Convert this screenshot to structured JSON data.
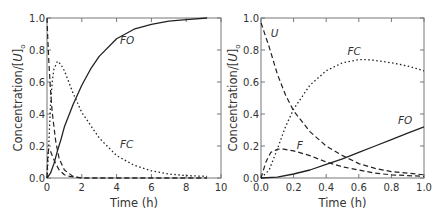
{
  "chart_data": [
    {
      "type": "line",
      "title": "",
      "xlabel": "Time (h)",
      "ylabel": "Concentration/[U]o",
      "xlim": [
        0,
        10
      ],
      "ylim": [
        0,
        1.0
      ],
      "xticks": [
        "0",
        "2",
        "4",
        "6",
        "8",
        "10"
      ],
      "yticks": [
        "0.0",
        "0.2",
        "0.4",
        "0.6",
        "0.8",
        "1.0"
      ],
      "grid": false,
      "series": [
        {
          "name": "U",
          "style": "dashed",
          "x": [
            0,
            0.05,
            0.1,
            0.2,
            0.3,
            0.5,
            0.7,
            1.0,
            1.5,
            2,
            4,
            6,
            8,
            9.2
          ],
          "values": [
            1.0,
            0.86,
            0.74,
            0.55,
            0.41,
            0.23,
            0.12,
            0.05,
            0.01,
            0.0,
            0.0,
            0.0,
            0.0,
            0.0
          ]
        },
        {
          "name": "F",
          "style": "dashed",
          "x": [
            0,
            0.05,
            0.1,
            0.15,
            0.3,
            0.5,
            0.7,
            1.0,
            1.3,
            2,
            4,
            6,
            8,
            9.2
          ],
          "values": [
            0.0,
            0.15,
            0.18,
            0.18,
            0.14,
            0.09,
            0.05,
            0.02,
            0.01,
            0.0,
            0.0,
            0.0,
            0.0,
            0.0
          ]
        },
        {
          "name": "FC",
          "style": "dotted",
          "x": [
            0,
            0.1,
            0.2,
            0.3,
            0.4,
            0.6,
            0.8,
            1.0,
            1.5,
            2,
            3,
            4,
            5,
            6,
            7,
            8,
            9.2
          ],
          "values": [
            0.0,
            0.2,
            0.45,
            0.6,
            0.68,
            0.73,
            0.71,
            0.67,
            0.53,
            0.41,
            0.25,
            0.14,
            0.08,
            0.045,
            0.025,
            0.015,
            0.01
          ]
        },
        {
          "name": "FO",
          "style": "solid",
          "x": [
            0,
            0.2,
            0.4,
            0.6,
            0.8,
            1.0,
            1.5,
            2,
            2.5,
            3,
            4,
            5,
            6,
            7,
            8,
            9.2
          ],
          "values": [
            0.0,
            0.03,
            0.09,
            0.17,
            0.24,
            0.32,
            0.46,
            0.58,
            0.68,
            0.76,
            0.87,
            0.93,
            0.96,
            0.98,
            0.99,
            1.0
          ]
        }
      ],
      "annotations": [
        {
          "text": "FO",
          "x": 4.2,
          "y": 0.84
        },
        {
          "text": "FC",
          "x": 4.2,
          "y": 0.19
        }
      ]
    },
    {
      "type": "line",
      "title": "",
      "xlabel": "Time (h)",
      "ylabel": "Concentration/[U]o",
      "xlim": [
        0,
        1.0
      ],
      "ylim": [
        0,
        1.0
      ],
      "xticks": [
        "0.0",
        "0.2",
        "0.4",
        "0.6",
        "0.8",
        "1.0"
      ],
      "yticks": [
        "0.0",
        "0.2",
        "0.4",
        "0.6",
        "0.8",
        "1.0"
      ],
      "grid": false,
      "series": [
        {
          "name": "U",
          "style": "dashed",
          "x": [
            0,
            0.05,
            0.1,
            0.15,
            0.2,
            0.3,
            0.4,
            0.5,
            0.6,
            0.7,
            0.8,
            0.9,
            1.0
          ],
          "values": [
            0.97,
            0.82,
            0.65,
            0.52,
            0.42,
            0.29,
            0.2,
            0.14,
            0.09,
            0.06,
            0.04,
            0.03,
            0.02
          ]
        },
        {
          "name": "F",
          "style": "dashed",
          "x": [
            0,
            0.03,
            0.06,
            0.1,
            0.14,
            0.2,
            0.3,
            0.4,
            0.5,
            0.6,
            0.7,
            0.8,
            0.9,
            1.0
          ],
          "values": [
            0.0,
            0.1,
            0.16,
            0.18,
            0.18,
            0.17,
            0.14,
            0.1,
            0.07,
            0.05,
            0.03,
            0.02,
            0.015,
            0.01
          ]
        },
        {
          "name": "FC",
          "style": "dotted",
          "x": [
            0,
            0.05,
            0.1,
            0.15,
            0.2,
            0.3,
            0.4,
            0.5,
            0.6,
            0.65,
            0.7,
            0.8,
            0.9,
            1.0
          ],
          "values": [
            0.0,
            0.05,
            0.18,
            0.32,
            0.43,
            0.58,
            0.67,
            0.72,
            0.74,
            0.74,
            0.735,
            0.72,
            0.7,
            0.67
          ]
        },
        {
          "name": "FO",
          "style": "solid",
          "x": [
            0,
            0.1,
            0.2,
            0.3,
            0.4,
            0.5,
            0.6,
            0.7,
            0.8,
            0.9,
            1.0
          ],
          "values": [
            0.0,
            0.005,
            0.025,
            0.05,
            0.085,
            0.12,
            0.16,
            0.2,
            0.24,
            0.28,
            0.32
          ]
        }
      ],
      "annotations": [
        {
          "text": "U",
          "x": 0.06,
          "y": 0.88
        },
        {
          "text": "FC",
          "x": 0.53,
          "y": 0.77
        },
        {
          "text": "F",
          "x": 0.22,
          "y": 0.18
        },
        {
          "text": "FO",
          "x": 0.84,
          "y": 0.34
        }
      ]
    }
  ]
}
